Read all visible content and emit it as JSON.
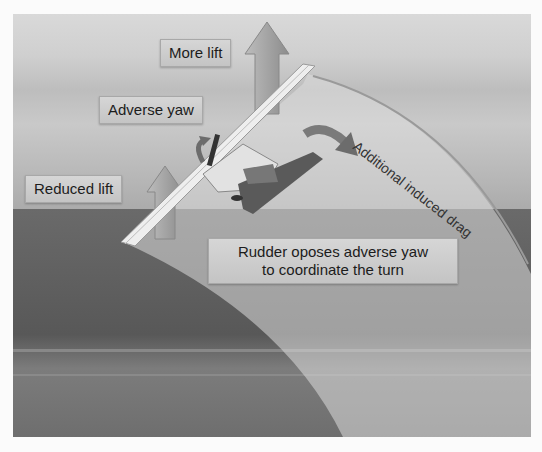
{
  "figure": {
    "type": "diagram",
    "labels": {
      "more_lift": "More lift",
      "adverse_yaw": "Adverse yaw",
      "reduced_lift": "Reduced lift",
      "induced_drag": "Additional induced drag",
      "rudder_line1": "Rudder oposes adverse yaw",
      "rudder_line2": "to coordinate the turn"
    },
    "colors": {
      "arrow_fill": "#a0a0a0",
      "drag_arrow": "#7a7a7a",
      "label_bg": "#cccccc",
      "tail": "#5a5a5a"
    }
  }
}
